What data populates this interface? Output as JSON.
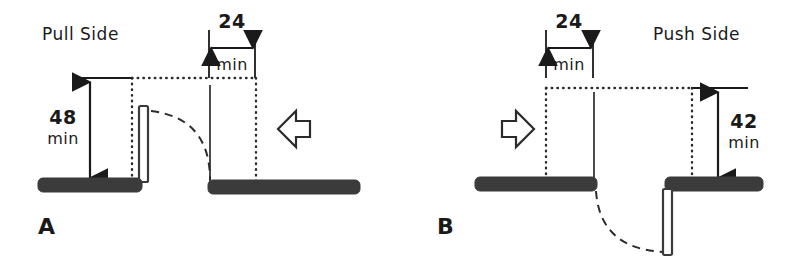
{
  "figure": {
    "background_color": "#ffffff",
    "ink_color": "#2b2b2b",
    "wall_color": "#3b3b3b"
  },
  "panels": [
    {
      "id": "A",
      "label": "A",
      "side_label": "Pull Side",
      "approach_arrow": "arrow-left-icon",
      "approach_direction": "left",
      "dimensions": [
        {
          "name": "depth",
          "value": "48",
          "qualifier": "min",
          "orientation": "vertical",
          "units": "inches"
        },
        {
          "name": "latch-side-clearance",
          "value": "24",
          "qualifier": "min",
          "orientation": "horizontal",
          "units": "inches"
        }
      ],
      "door_swing": "pull",
      "door_leaf": "vertical-open-leaf"
    },
    {
      "id": "B",
      "label": "B",
      "side_label": "Push Side",
      "approach_arrow": "arrow-right-icon",
      "approach_direction": "right",
      "dimensions": [
        {
          "name": "latch-side-clearance",
          "value": "24",
          "qualifier": "min",
          "orientation": "horizontal",
          "units": "inches"
        },
        {
          "name": "depth",
          "value": "42",
          "qualifier": "min",
          "orientation": "vertical",
          "units": "inches"
        }
      ],
      "door_swing": "push",
      "door_leaf": "vertical-open-leaf"
    }
  ]
}
